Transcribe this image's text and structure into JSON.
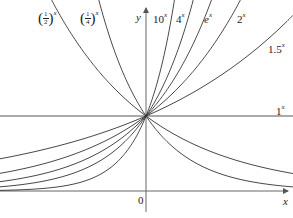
{
  "chart_data": {
    "type": "line",
    "title": "",
    "xlabel": "x",
    "ylabel": "y",
    "origin_label": "0",
    "grid": false,
    "legend": "inline labels at curve ends",
    "x_range": [
      -2.09,
      2.06
    ],
    "y_range": [
      -0.27,
      2.55
    ],
    "series": [
      {
        "name": "(1/2)^x",
        "base": 0.5,
        "label_position": "top-left"
      },
      {
        "name": "(1/4)^x",
        "base": 0.25,
        "label_position": "top-left"
      },
      {
        "name": "10^x",
        "base": 10,
        "label_position": "top"
      },
      {
        "name": "4^x",
        "base": 4,
        "label_position": "top"
      },
      {
        "name": "e^x",
        "base": 2.718,
        "label_position": "top"
      },
      {
        "name": "2^x",
        "base": 2,
        "label_position": "top"
      },
      {
        "name": "1.5^x",
        "base": 1.5,
        "label_position": "right"
      },
      {
        "name": "1^x",
        "base": 1,
        "label_position": "right"
      }
    ],
    "unlabeled_curves_left_side": "reflections approaching 0 as x→-∞ are the left branches of 1.5^x, 2^x, e^x, 4^x, 10^x; right-decaying curves are (1/2)^x and (1/4)^x",
    "common_point": {
      "x": 0,
      "y": 1
    }
  },
  "labels": {
    "half": {
      "num": "1",
      "den": "2",
      "exp": "x"
    },
    "quarter": {
      "num": "1",
      "den": "4",
      "exp": "x"
    },
    "y_axis": "y",
    "x_axis": "x",
    "origin": "0",
    "ten": {
      "base": "10",
      "exp": "x"
    },
    "four": {
      "base": "4",
      "exp": "x"
    },
    "e": {
      "base": "e",
      "exp": "x"
    },
    "two": {
      "base": "2",
      "exp": "x"
    },
    "onehalf5": {
      "base": "1.5",
      "exp": "x"
    },
    "one": {
      "base": "1",
      "exp": "x"
    }
  },
  "colors": {
    "curve": "#333333",
    "axis": "#555555",
    "background": "#ffffff"
  }
}
